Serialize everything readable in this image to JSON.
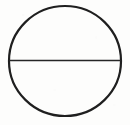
{
  "figure": {
    "title": "Circle with horizontal diameter",
    "kind": "geometric-line-drawing",
    "canvas": {
      "width": 130,
      "height": 125,
      "background_color": "#fdfdfc"
    },
    "ink_color": "#1a1a1a",
    "shapes": {
      "circle": {
        "name": "circle-outline",
        "center_x": 65,
        "center_y": 61,
        "radius_x": 56,
        "radius_y": 55,
        "stroke_width": 2.2,
        "stroke_color": "#1f1f1f",
        "fill": "none"
      },
      "diameter": {
        "name": "horizontal-diameter-line",
        "x1": 9,
        "y1": 60.5,
        "x2": 121,
        "y2": 60.5,
        "stroke_width": 1.5,
        "stroke_color": "#262626"
      }
    },
    "labels": [],
    "annotations": []
  }
}
